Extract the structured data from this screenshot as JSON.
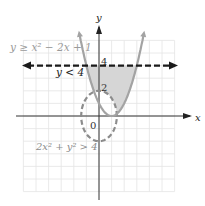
{
  "chart_data": {
    "type": "line",
    "title": "",
    "xlabel": "x",
    "ylabel": "y",
    "xlim": [
      -6,
      6
    ],
    "ylim": [
      -6,
      6
    ],
    "grid": true,
    "tick_labels": {
      "origin": "0",
      "y": [
        "2",
        "4"
      ]
    },
    "series": [
      {
        "name": "y ≥ x² − 2x + 1",
        "kind": "parabola",
        "equation": "y = x^2 - 2x + 1",
        "style": "solid",
        "color": "#a0a0a0",
        "label": "y ≥ x² − 2x + 1"
      },
      {
        "name": "y < 4",
        "kind": "horizontal_line",
        "equation": "y = 4",
        "style": "dashed",
        "color": "#1a1a1a",
        "label": "y < 4"
      },
      {
        "name": "2x² + y² > 4",
        "kind": "ellipse",
        "equation": "2x^2 + y^2 = 4",
        "style": "dashed",
        "color": "#8c8c8c",
        "label": "2x² + y² > 4"
      }
    ],
    "shaded_region": "between parabola and y=4, outside ellipse",
    "shade_color": "#d3d3d3"
  },
  "labels": {
    "parabola": "y ≥ x² − 2x + 1",
    "line": "y < 4",
    "ellipse": "2x² + y² > 4",
    "x_axis": "x",
    "y_axis": "y",
    "origin": "0",
    "tick_2": "2",
    "tick_4": "4"
  }
}
